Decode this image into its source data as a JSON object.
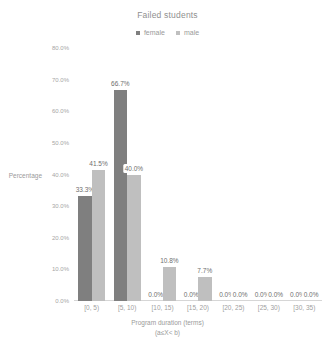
{
  "chart_data": {
    "type": "bar",
    "title": "Failed students",
    "xlabel": "Program duration (terms)",
    "xlabel_sub": "(a≤X< b)",
    "ylabel": "Percentage",
    "categories": [
      "[0, 5)",
      "[5, 10)",
      "[10, 15)",
      "[15, 20)",
      "[20, 25)",
      "[25, 30)",
      "[30, 35)"
    ],
    "series": [
      {
        "name": "female",
        "color": "#7f7f7f",
        "values": [
          33.3,
          66.7,
          0.0,
          0.0,
          0.0,
          0.0,
          0.0
        ],
        "labels": [
          "33.3%",
          "66.7%",
          "0.0%",
          "0.0%",
          "0.0%",
          "0.0%",
          "0.0%"
        ]
      },
      {
        "name": "male",
        "color": "#bfbfbf",
        "values": [
          41.5,
          40.0,
          10.8,
          7.7,
          0.0,
          0.0,
          0.0
        ],
        "labels": [
          "41.5%",
          "40.0%",
          "10.8%",
          "7.7%",
          "0.0%",
          "0.0%",
          "0.0%"
        ]
      }
    ],
    "ylim": [
      0,
      80
    ],
    "yticks": [
      0,
      10,
      20,
      30,
      40,
      50,
      60,
      70,
      80
    ],
    "ytick_labels": [
      "0.0%",
      "10.0%",
      "20.0%",
      "30.0%",
      "40.0%",
      "50.0%",
      "60.0%",
      "70.0%",
      "80.0%"
    ],
    "grid": false,
    "legend_position": "top",
    "value_labels": true
  }
}
